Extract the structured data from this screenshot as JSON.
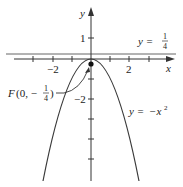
{
  "figure": {
    "type": "graph",
    "axes": {
      "x_label": "x",
      "y_label": "y",
      "x_tick_labels": [
        {
          "value": -2,
          "text": "−2"
        },
        {
          "value": 2,
          "text": "2"
        }
      ],
      "y_tick_labels": [
        {
          "value": 1,
          "text": "1"
        },
        {
          "value": -2,
          "text": "−2"
        }
      ],
      "x_ticks": [
        -3,
        -2,
        -1,
        1,
        2,
        3
      ],
      "y_ticks": [
        1,
        -1,
        -2,
        -3,
        -4,
        -5
      ]
    },
    "curves": [
      {
        "name": "parabola",
        "equation_label": "y = −x²",
        "y_eq": "y =",
        "rhs": "−x",
        "exp": "2"
      }
    ],
    "directrix": {
      "label_lhs": "y =",
      "num": "1",
      "den": "4"
    },
    "focus": {
      "label_prefix": "F",
      "label_open": "(0, −",
      "num": "1",
      "den": "4",
      "label_close": ")"
    },
    "colors": {
      "curve": "#3a3a3a",
      "axis": "#333333",
      "directrix": "#555555"
    }
  }
}
